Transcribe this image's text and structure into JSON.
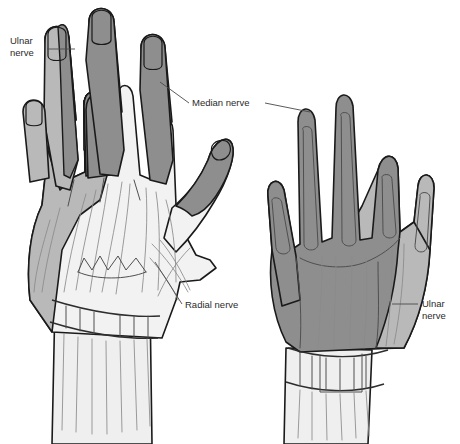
{
  "figure": {
    "background_color": "#ffffff",
    "width": 460,
    "height": 444
  },
  "labels": [
    {
      "id": "ulnar-left",
      "name": "ulnar-nerve-label-left",
      "lines": [
        "Ulnar",
        "nerve"
      ],
      "line1": "Ulnar",
      "line2": "nerve",
      "x": 10,
      "y": 44,
      "anchor": "start"
    },
    {
      "id": "median",
      "name": "median-nerve-label",
      "lines": [
        "Median nerve"
      ],
      "line1": "Median nerve",
      "x": 192,
      "y": 106,
      "anchor": "start"
    },
    {
      "id": "radial",
      "name": "radial-nerve-label",
      "lines": [
        "Radial nerve"
      ],
      "line1": "Radial nerve",
      "x": 185,
      "y": 308,
      "anchor": "start"
    },
    {
      "id": "ulnar-right",
      "name": "ulnar-nerve-label-right",
      "lines": [
        "Ulnar",
        "nerve"
      ],
      "line1": "Ulnar",
      "line2": "nerve",
      "x": 422,
      "y": 307,
      "anchor": "start"
    }
  ],
  "nerve_territories": [
    {
      "nerve": "Ulnar nerve",
      "color": "#b9b9b9",
      "views": [
        "dorsal (left hand): little finger, ring finger ulnar half, ulnar border of hand",
        "palmar (right hand): ulnar border, little finger"
      ]
    },
    {
      "nerve": "Median nerve",
      "color": "#8e8e8e",
      "views": [
        "dorsal (left hand): distal thumb, index, middle and radial half of ring fingertips",
        "palmar (right hand): thumb, index, middle, radial half of ring finger and central palm"
      ]
    },
    {
      "nerve": "Radial nerve",
      "color": "#f2f2f2",
      "views": [
        "dorsal (left hand): dorsum of hand, proximal thumb and proximal dorsal fingers"
      ]
    }
  ],
  "views": [
    {
      "id": "left-hand",
      "name": "left-hand-dorsal-view",
      "description": "Dorsal (back) view of the hand"
    },
    {
      "id": "right-hand",
      "name": "right-hand-palmar-view",
      "description": "Palmar (front) view of the hand"
    }
  ],
  "colors": {
    "dark_gray": "#8e8e8e",
    "light_gray": "#b9b9b9",
    "near_white": "#f2f2f2",
    "outline": "#1a1a1a",
    "text": "#2b2b2b",
    "background": "#ffffff"
  }
}
